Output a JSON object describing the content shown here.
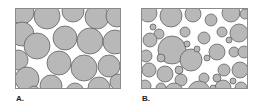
{
  "figure": {
    "panels": [
      {
        "id": "A",
        "label": "A.",
        "description": "Packing of roughly uniform-size circles",
        "frame": {
          "x": 15,
          "y": 8,
          "w": 106,
          "h": 81
        },
        "circles": [
          [
            7,
            4,
            12
          ],
          [
            32,
            8,
            13
          ],
          [
            58,
            3,
            11
          ],
          [
            82,
            9,
            12
          ],
          [
            102,
            8,
            11
          ],
          [
            7,
            26,
            12
          ],
          [
            22,
            38,
            13
          ],
          [
            50,
            30,
            12
          ],
          [
            75,
            33,
            13
          ],
          [
            100,
            34,
            12
          ],
          [
            3,
            52,
            10
          ],
          [
            44,
            55,
            12
          ],
          [
            69,
            60,
            13
          ],
          [
            94,
            58,
            11
          ],
          [
            12,
            71,
            12
          ],
          [
            36,
            78,
            11
          ],
          [
            60,
            84,
            9
          ],
          [
            84,
            80,
            11
          ],
          [
            103,
            74,
            8
          ],
          [
            19,
            84,
            6
          ]
        ]
      },
      {
        "id": "B",
        "label": "B.",
        "description": "Packing of mixed-size circles (large and small)",
        "frame": {
          "x": 141,
          "y": 8,
          "w": 107,
          "h": 81
        },
        "circles": [
          [
            7,
            5,
            9
          ],
          [
            30,
            8,
            11
          ],
          [
            52,
            6,
            8
          ],
          [
            70,
            12,
            6
          ],
          [
            90,
            5,
            9
          ],
          [
            104,
            6,
            5
          ],
          [
            18,
            26,
            5
          ],
          [
            9,
            32,
            7
          ],
          [
            44,
            24,
            5
          ],
          [
            31,
            42,
            14
          ],
          [
            63,
            30,
            6
          ],
          [
            81,
            24,
            5
          ],
          [
            98,
            25,
            9
          ],
          [
            5,
            48,
            6
          ],
          [
            20,
            50,
            4
          ],
          [
            50,
            52,
            11
          ],
          [
            76,
            44,
            8
          ],
          [
            93,
            44,
            5
          ],
          [
            103,
            44,
            6
          ],
          [
            8,
            62,
            7
          ],
          [
            24,
            66,
            8
          ],
          [
            38,
            62,
            4
          ],
          [
            40,
            72,
            6
          ],
          [
            63,
            70,
            5
          ],
          [
            83,
            62,
            6
          ],
          [
            99,
            62,
            8
          ],
          [
            4,
            78,
            6
          ],
          [
            20,
            80,
            5
          ],
          [
            33,
            84,
            9
          ],
          [
            58,
            84,
            11
          ],
          [
            82,
            80,
            8
          ],
          [
            100,
            80,
            6
          ],
          [
            56,
            41,
            3
          ],
          [
            66,
            50,
            3
          ],
          [
            46,
            36,
            3
          ],
          [
            88,
            32,
            3
          ],
          [
            12,
            19,
            3
          ],
          [
            76,
            70,
            4
          ],
          [
            92,
            73,
            3
          ],
          [
            72,
            80,
            3
          ]
        ]
      }
    ],
    "colors": {
      "circle_fill": "#b8b8b8",
      "circle_stroke": "#555555",
      "frame_stroke": "#8a8a8a",
      "background": "#ffffff"
    }
  }
}
